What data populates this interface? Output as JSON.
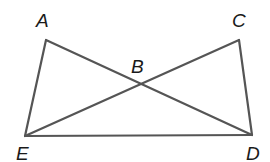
{
  "diagram": {
    "type": "geometry",
    "points": {
      "A": {
        "label": "A",
        "x": 46,
        "y": 40,
        "lx": 36,
        "ly": 27
      },
      "B": {
        "label": "B",
        "x": 141,
        "y": 84,
        "lx": 131,
        "ly": 73
      },
      "C": {
        "label": "C",
        "x": 239,
        "y": 40,
        "lx": 232,
        "ly": 27
      },
      "D": {
        "label": "D",
        "x": 252,
        "y": 135,
        "lx": 246,
        "ly": 160
      },
      "E": {
        "label": "E",
        "x": 25,
        "y": 136,
        "lx": 16,
        "ly": 160
      }
    },
    "segments": [
      {
        "from": "A",
        "to": "E"
      },
      {
        "from": "A",
        "to": "D"
      },
      {
        "from": "C",
        "to": "E"
      },
      {
        "from": "C",
        "to": "D"
      },
      {
        "from": "E",
        "to": "D"
      }
    ],
    "colors": {
      "line": "#555555",
      "label": "#1a1a1a"
    }
  }
}
